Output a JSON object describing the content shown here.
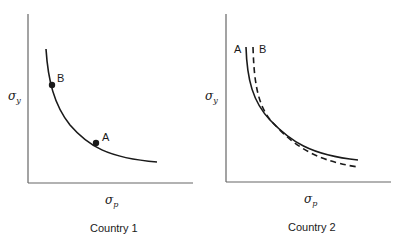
{
  "panels": [
    {
      "title": "Country 1",
      "y_axis_label": "σ",
      "y_axis_sub": "y",
      "x_axis_label": "σ",
      "x_axis_sub": "p",
      "curves": [
        {
          "name": "curve",
          "style": "solid"
        }
      ],
      "points": [
        {
          "label": "B"
        },
        {
          "label": "A"
        }
      ]
    },
    {
      "title": "Country 2",
      "y_axis_label": "σ",
      "y_axis_sub": "y",
      "x_axis_label": "σ",
      "x_axis_sub": "p",
      "curves": [
        {
          "name": "A",
          "style": "solid"
        },
        {
          "name": "B",
          "style": "dashed"
        }
      ]
    }
  ],
  "colors": {
    "axis": "#555555",
    "curve": "#1a1a1a"
  }
}
